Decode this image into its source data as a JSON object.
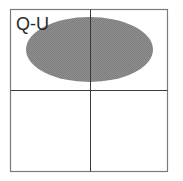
{
  "diagram": {
    "label": "Q-U",
    "colors": {
      "background": "#ffffff",
      "frame": "#7a7a7a",
      "grid": "#3a3a3a",
      "ellipse_fill": "#8c8c8c",
      "label": "#2a2a2a"
    },
    "frame": {
      "x": 10,
      "y": 9,
      "width": 158,
      "height": 163
    },
    "grid_lines": {
      "vertical_x": 90,
      "horizontal_y": 90
    },
    "ellipse": {
      "cx": 89.5,
      "cy": 49.5,
      "rx": 63.5,
      "ry": 32.5
    }
  }
}
